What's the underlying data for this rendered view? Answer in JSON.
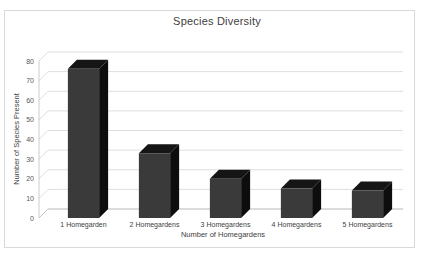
{
  "page": {
    "background": "#ffffff",
    "frame_border_color": "#d9d9d9"
  },
  "chart_data": {
    "type": "bar",
    "style": "3d-column",
    "title": "Species Diversity",
    "xlabel": "Number of Homegardens",
    "ylabel": "Number of Species Present",
    "categories": [
      "1 Homegarden",
      "2 Homegardens",
      "3 Homegardens",
      "4 Homegardens",
      "5 Homegardens"
    ],
    "values": [
      76,
      33,
      20,
      15,
      14
    ],
    "ylim": [
      0,
      80
    ],
    "yticks": [
      0,
      10,
      20,
      30,
      40,
      50,
      60,
      70,
      80
    ],
    "ytick_labels": [
      "0",
      "10",
      "20",
      "30",
      "40",
      "50",
      "60",
      "70",
      "80"
    ],
    "grid": true,
    "legend": false,
    "legend_position": "none",
    "bar_color": "#3a3a3a",
    "bar_top_color": "#151515",
    "bar_side_color": "#0d0d0d",
    "gridline_color": "#d0d0d0"
  }
}
